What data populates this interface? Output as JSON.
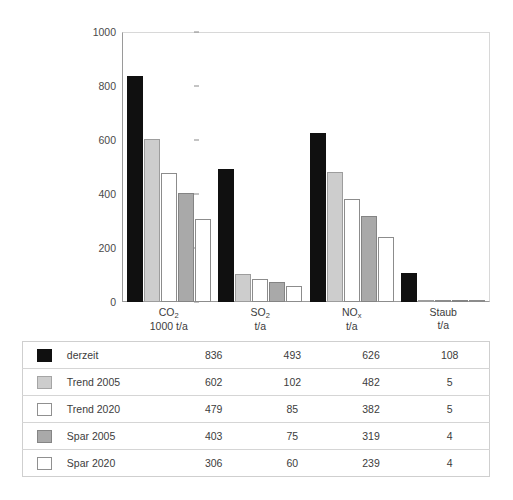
{
  "chart_data": {
    "type": "bar",
    "title": "",
    "xlabel": "",
    "ylabel": "",
    "ylim": [
      0,
      1000
    ],
    "yticks": [
      0,
      200,
      400,
      600,
      800,
      1000
    ],
    "grid": false,
    "legend_position": "table-below",
    "categories": [
      "CO2",
      "SO2",
      "NOx",
      "Staub"
    ],
    "category_labels": [
      {
        "name": "CO",
        "sub": "2",
        "unit": "1000 t/a"
      },
      {
        "name": "SO",
        "sub": "2",
        "unit": "t/a"
      },
      {
        "name": "NO",
        "sub": "x",
        "unit": "t/a"
      },
      {
        "name": "Staub",
        "sub": "",
        "unit": "t/a"
      }
    ],
    "series": [
      {
        "name": "derzeit",
        "style": "s-black",
        "color": "#101010",
        "values": [
          836,
          493,
          626,
          108
        ]
      },
      {
        "name": "Trend 2005",
        "style": "s-ltgray",
        "color": "#cdcdcd",
        "values": [
          602,
          102,
          482,
          5
        ]
      },
      {
        "name": "Trend 2020",
        "style": "s-white",
        "color": "#ffffff",
        "values": [
          479,
          85,
          382,
          5
        ]
      },
      {
        "name": "Spar 2005",
        "style": "s-mdgray",
        "color": "#a9a9a9",
        "values": [
          403,
          75,
          319,
          4
        ]
      },
      {
        "name": "Spar 2020",
        "style": "s-white",
        "color": "#ffffff",
        "values": [
          306,
          60,
          239,
          4
        ]
      }
    ]
  },
  "table": {
    "rows": [
      {
        "swatch": "s-black",
        "label": "derzeit",
        "values": [
          "836",
          "493",
          "626",
          "108"
        ]
      },
      {
        "swatch": "s-ltgray",
        "label": "Trend 2005",
        "values": [
          "602",
          "102",
          "482",
          "5"
        ]
      },
      {
        "swatch": "s-white",
        "label": "Trend 2020",
        "values": [
          "479",
          "85",
          "382",
          "5"
        ]
      },
      {
        "swatch": "s-mdgray",
        "label": "Spar 2005",
        "values": [
          "403",
          "75",
          "319",
          "4"
        ]
      },
      {
        "swatch": "s-white",
        "label": "Spar 2020",
        "values": [
          "306",
          "60",
          "239",
          "4"
        ]
      }
    ]
  }
}
